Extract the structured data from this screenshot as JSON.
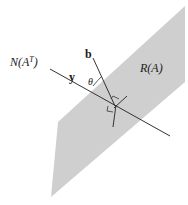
{
  "diagram": {
    "plane_label": "R(A)",
    "line_label_prefix": "N(A",
    "line_label_sup": "T",
    "line_label_suffix": ")",
    "vector_b_label": "b",
    "vector_y_label": "y",
    "angle_label": "θ",
    "colors": {
      "plane": "#cfcfcf",
      "lines": "#333333",
      "background": "#ffffff"
    }
  }
}
